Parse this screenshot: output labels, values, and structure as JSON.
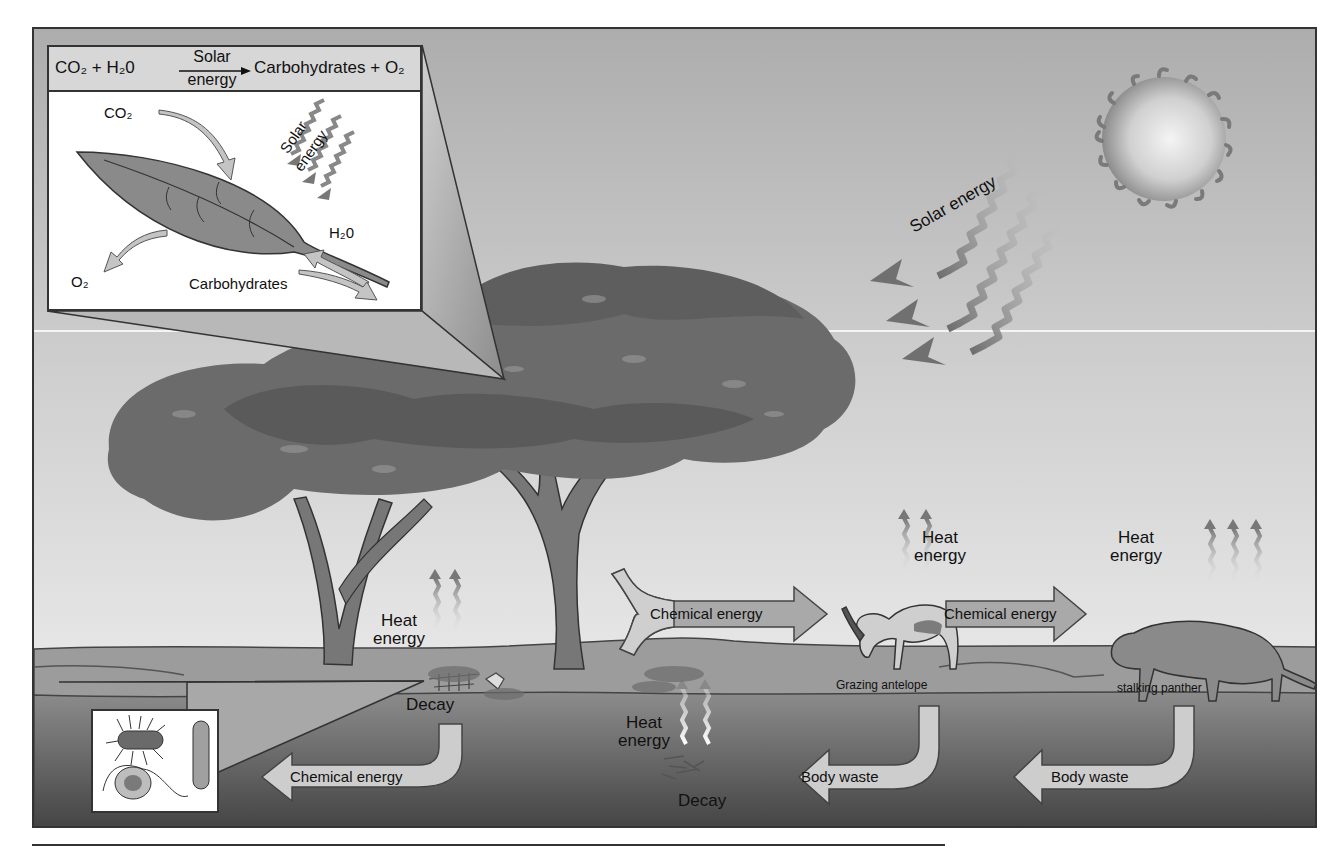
{
  "diagram": {
    "type": "energy-flow-ecosystem",
    "colors": {
      "sky_top": "#afafaf",
      "sky_bottom": "#e4e4e4",
      "ground": "#9c9c9c",
      "soil_top": "#8a8a8a",
      "soil_bottom": "#454545",
      "foliage": "#6e6e6e",
      "foliage_dark": "#5c5c5c",
      "trunk": "#777777",
      "arrow_fill": "#9a9a9a",
      "arrow_light": "#cfcfcf",
      "outline": "#333333"
    }
  },
  "photosynthesis_inset": {
    "equation": {
      "reactants": "CO₂ + H₂0",
      "arrow_top": "Solar",
      "arrow_bottom": "energy",
      "products": "Carbohydrates + O₂"
    },
    "labels": {
      "co2": "CO₂",
      "solar_line1": "Solar",
      "solar_line2": "energy",
      "h2o": "H₂0",
      "o2": "O₂",
      "carbohydrates": "Carbohydrates"
    }
  },
  "sky": {
    "solar_energy_label": "Solar energy"
  },
  "labels": {
    "heat_energy_tree_1": "Heat",
    "heat_energy_tree_2": "energy",
    "heat_energy_antelope_1": "Heat",
    "heat_energy_antelope_2": "energy",
    "heat_energy_panther_1": "Heat",
    "heat_energy_panther_2": "energy",
    "heat_energy_soil_1": "Heat",
    "heat_energy_soil_2": "energy",
    "decay_carcass": "Decay",
    "decay_waste": "Decay",
    "grazing_antelope": "Grazing antelope",
    "stalking_panther": "stalking panther"
  },
  "arrows": {
    "tree_to_antelope": "Chemical energy",
    "antelope_to_panther": "Chemical energy",
    "decay_to_decomposers": "Chemical energy",
    "antelope_body_waste": "Body waste",
    "panther_body_waste": "Body waste"
  }
}
